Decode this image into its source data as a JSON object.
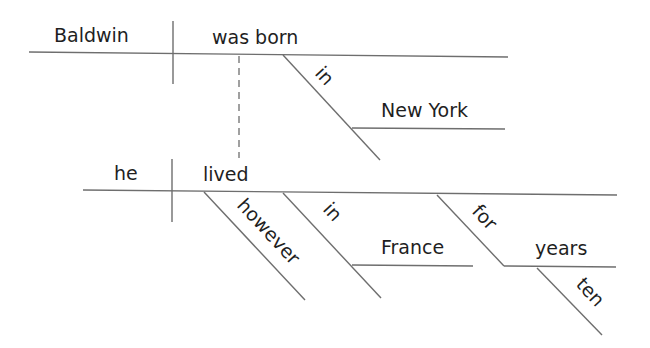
{
  "diagram": {
    "type": "sentence-diagram",
    "clause_main": {
      "subject": "Baldwin",
      "verb": "was born",
      "modifiers": [
        {
          "preposition": "in",
          "object": "New York"
        }
      ]
    },
    "clause_relative": {
      "subject": "he",
      "verb": "lived",
      "modifiers": [
        {
          "adverb": "however"
        },
        {
          "preposition": "in",
          "object": "France"
        },
        {
          "preposition": "for",
          "object": "years",
          "object_modifier": "ten"
        }
      ]
    },
    "connector": "dashed"
  },
  "labels": {
    "baldwin": "Baldwin",
    "was_born": "was born",
    "in_1": "in",
    "new_york": "New York",
    "he": "he",
    "lived": "lived",
    "however": "however",
    "in_2": "in",
    "france": "France",
    "for": "for",
    "years": "years",
    "ten": "ten"
  },
  "colors": {
    "line": "#6e6e6e",
    "text": "#1f1f1f",
    "background": "#ffffff"
  }
}
